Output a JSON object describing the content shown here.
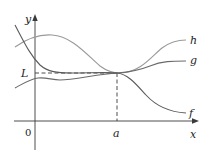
{
  "figure": {
    "axis_labels": {
      "x": "x",
      "y": "y"
    },
    "origin_label": "0",
    "limit_label": "L",
    "point_label": "a",
    "curves": [
      {
        "id": "h",
        "label": "h",
        "color": "#9a9a9a"
      },
      {
        "id": "g",
        "label": "g",
        "color": "#6a6a6a"
      },
      {
        "id": "f",
        "label": "f",
        "color": "#5a5a5a"
      }
    ]
  }
}
